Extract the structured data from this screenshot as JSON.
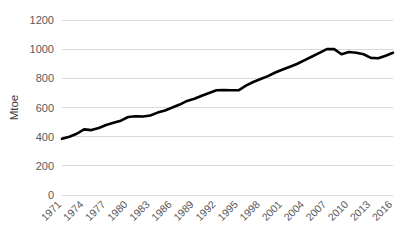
{
  "chart_data": {
    "type": "line",
    "title": "",
    "xlabel": "",
    "ylabel": "Mtoe",
    "ylim": [
      0,
      1200
    ],
    "xlim": [
      1971,
      2016
    ],
    "grid": true,
    "legend": false,
    "legend_position": "none",
    "series_color": "#000000",
    "grid_color": "#d9d9d9",
    "background_color": "#ffffff",
    "tick_color": "#595959",
    "y_ticks": [
      "0",
      "200",
      "400",
      "600",
      "800",
      "1000",
      "1200"
    ],
    "y_tick_values": [
      0,
      200,
      400,
      600,
      800,
      1000,
      1200
    ],
    "x_ticks": [
      "1971",
      "1974",
      "1977",
      "1980",
      "1983",
      "1986",
      "1989",
      "1992",
      "1995",
      "1998",
      "2001",
      "2004",
      "2007",
      "2010",
      "2013",
      "2016"
    ],
    "x_tick_values": [
      1971,
      1974,
      1977,
      1980,
      1983,
      1986,
      1989,
      1992,
      1995,
      1998,
      2001,
      2004,
      2007,
      2010,
      2013,
      2016
    ],
    "x": [
      1971,
      1972,
      1973,
      1974,
      1975,
      1976,
      1977,
      1978,
      1979,
      1980,
      1981,
      1982,
      1983,
      1984,
      1985,
      1986,
      1987,
      1988,
      1989,
      1990,
      1991,
      1992,
      1993,
      1994,
      1995,
      1996,
      1997,
      1998,
      1999,
      2000,
      2001,
      2002,
      2003,
      2004,
      2005,
      2006,
      2007,
      2008,
      2009,
      2010,
      2011,
      2012,
      2013,
      2014,
      2015,
      2016
    ],
    "values": [
      385,
      400,
      420,
      450,
      445,
      460,
      480,
      495,
      510,
      535,
      540,
      538,
      545,
      565,
      580,
      600,
      620,
      645,
      660,
      680,
      700,
      718,
      720,
      718,
      718,
      750,
      775,
      795,
      815,
      840,
      860,
      880,
      900,
      925,
      950,
      975,
      1000,
      1000,
      965,
      980,
      975,
      965,
      940,
      938,
      955,
      975
    ],
    "series": [
      {
        "name": "Mtoe",
        "values": [
          385,
          400,
          420,
          450,
          445,
          460,
          480,
          495,
          510,
          535,
          540,
          538,
          545,
          565,
          580,
          600,
          620,
          645,
          660,
          680,
          700,
          718,
          720,
          718,
          718,
          750,
          775,
          795,
          815,
          840,
          860,
          880,
          900,
          925,
          950,
          975,
          1000,
          1000,
          965,
          980,
          975,
          965,
          940,
          938,
          955,
          975
        ]
      }
    ]
  }
}
